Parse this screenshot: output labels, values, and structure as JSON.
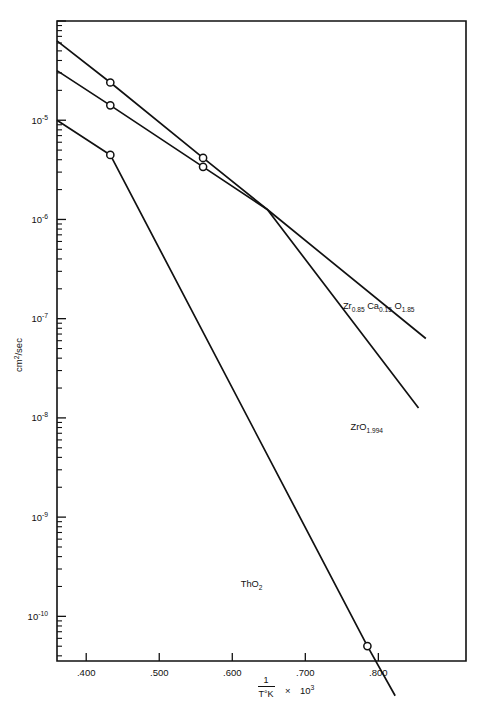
{
  "chart_data": {
    "type": "line",
    "title": "",
    "subtitle": "",
    "xlabel_parts": {
      "numerator": "1",
      "denominator": "T°K",
      "times": "×",
      "factor_base": "10",
      "factor_exp": "3"
    },
    "xlabel": "1/T°K × 10³",
    "ylabel": "cm2/sec",
    "ylabel_base": "cm",
    "ylabel_exp": "2",
    "ylabel_tail": "/sec",
    "scale": {
      "x": "linear",
      "y": "log"
    },
    "xlim": [
      0.36,
      0.92
    ],
    "ylim_exponents": [
      -10.45,
      -4.0
    ],
    "grid": false,
    "legend": "inline-annotations",
    "xticks": [
      {
        "value": 0.4,
        "label": ".400"
      },
      {
        "value": 0.5,
        "label": ".500"
      },
      {
        "value": 0.6,
        "label": ".600"
      },
      {
        "value": 0.7,
        "label": ".700"
      },
      {
        "value": 0.8,
        "label": ".800"
      }
    ],
    "yticks": [
      {
        "exponent": -5,
        "base": "10",
        "exp_label": "-5"
      },
      {
        "exponent": -6,
        "base": "10",
        "exp_label": "-6"
      },
      {
        "exponent": -7,
        "base": "10",
        "exp_label": "-7"
      },
      {
        "exponent": -8,
        "base": "10",
        "exp_label": "-8"
      },
      {
        "exponent": -9,
        "base": "10",
        "exp_label": "-9"
      },
      {
        "exponent": -10,
        "base": "10",
        "exp_label": "-10"
      }
    ],
    "series": [
      {
        "name": "Zr0.85Ca0.15O1.85",
        "label_base1": "Zr",
        "label_sub1": "0.85",
        "label_base2": "Ca",
        "label_sub2": "0.15",
        "label_base3": "O",
        "label_sub3": "1.85",
        "line": [
          {
            "x": 0.36,
            "y_exponent": -4.2
          },
          {
            "x": 0.433,
            "y_exponent": -4.62
          },
          {
            "x": 0.56,
            "y_exponent": -5.38
          },
          {
            "x": 0.648,
            "y_exponent": -5.9
          },
          {
            "x": 0.865,
            "y_exponent": -7.2
          }
        ],
        "markers": [
          {
            "x": 0.433,
            "y_exponent": -4.62
          },
          {
            "x": 0.56,
            "y_exponent": -5.38
          }
        ]
      },
      {
        "name": "ZrO1.994",
        "label_base1": "ZrO",
        "label_sub1": "1.994",
        "line": [
          {
            "x": 0.36,
            "y_exponent": -4.5
          },
          {
            "x": 0.433,
            "y_exponent": -4.85
          },
          {
            "x": 0.56,
            "y_exponent": -5.47
          },
          {
            "x": 0.648,
            "y_exponent": -5.9
          },
          {
            "x": 0.855,
            "y_exponent": -7.9
          }
        ],
        "markers": [
          {
            "x": 0.433,
            "y_exponent": -4.85
          },
          {
            "x": 0.56,
            "y_exponent": -5.47
          }
        ]
      },
      {
        "name": "ThO2",
        "label_base1": "ThO",
        "label_sub1": "2",
        "line": [
          {
            "x": 0.36,
            "y_exponent": -5.0
          },
          {
            "x": 0.433,
            "y_exponent": -5.35
          },
          {
            "x": 0.785,
            "y_exponent": -10.3
          },
          {
            "x": 0.823,
            "y_exponent": -10.8
          }
        ],
        "markers": [
          {
            "x": 0.433,
            "y_exponent": -5.35
          },
          {
            "x": 0.785,
            "y_exponent": -10.3
          }
        ]
      }
    ],
    "annotations": [
      {
        "id": "zr-ca-label",
        "text": "Zr0.85 Ca0.15 O1.85",
        "x": 0.872,
        "y_exponent": -6.9
      },
      {
        "id": "zro-label",
        "text": "ZrO1.994",
        "x": 0.855,
        "y_exponent": -8.12
      },
      {
        "id": "tho2-label",
        "text": "ThO2",
        "x": 0.68,
        "y_exponent": -9.7
      }
    ]
  }
}
